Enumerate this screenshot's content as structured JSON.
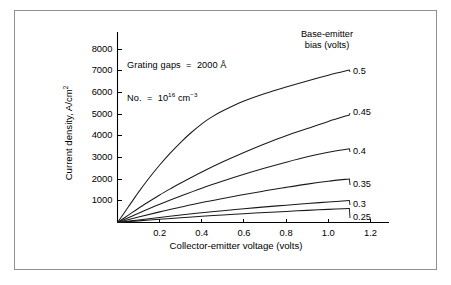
{
  "chart_data": {
    "type": "line",
    "title": "",
    "xlabel": "Collector-emitter voltage (volts)",
    "ylabel": "Current density, A/cm²",
    "xlim": [
      0,
      1.25
    ],
    "ylim": [
      0,
      8600
    ],
    "xticks": [
      "0.2",
      "0.4",
      "0.6",
      "0.8",
      "1.0",
      "1.2"
    ],
    "xtick_values": [
      0.2,
      0.4,
      0.6,
      0.8,
      1.0,
      1.2
    ],
    "yticks": [
      "1000",
      "2000",
      "3000",
      "4000",
      "5000",
      "6000",
      "7000",
      "8000"
    ],
    "ytick_values": [
      1000,
      2000,
      3000,
      4000,
      5000,
      6000,
      7000,
      8000
    ],
    "grid": false,
    "legend_position": "right-labels",
    "legend_title": "Base-emitter bias (volts)",
    "annotations": [
      "Grating gaps  =  2000 Å",
      "No.  =  10¹⁶ cm⁻³"
    ],
    "series": [
      {
        "name": "0.5",
        "label": "0.5",
        "x": [
          0,
          0.05,
          0.1,
          0.15,
          0.2,
          0.25,
          0.3,
          0.35,
          0.4,
          0.45,
          0.5,
          0.6,
          0.7,
          0.8,
          0.9,
          1.0,
          1.1
        ],
        "values": [
          0,
          700,
          1400,
          2050,
          2650,
          3200,
          3700,
          4150,
          4550,
          4880,
          5150,
          5600,
          5950,
          6250,
          6530,
          6790,
          7030
        ]
      },
      {
        "name": "0.45",
        "label": "0.45",
        "x": [
          0,
          0.05,
          0.1,
          0.15,
          0.2,
          0.25,
          0.3,
          0.4,
          0.5,
          0.6,
          0.7,
          0.8,
          0.9,
          1.0,
          1.1
        ],
        "values": [
          0,
          330,
          660,
          970,
          1270,
          1550,
          1820,
          2330,
          2800,
          3230,
          3630,
          4000,
          4330,
          4660,
          4960
        ]
      },
      {
        "name": "0.4",
        "label": "0.4",
        "x": [
          0,
          0.1,
          0.2,
          0.3,
          0.4,
          0.5,
          0.6,
          0.7,
          0.8,
          0.9,
          1.0,
          1.1
        ],
        "values": [
          0,
          430,
          840,
          1220,
          1580,
          1910,
          2220,
          2510,
          2780,
          3030,
          3240,
          3400
        ]
      },
      {
        "name": "0.35",
        "label": "0.35",
        "x": [
          0,
          0.1,
          0.2,
          0.3,
          0.4,
          0.5,
          0.6,
          0.7,
          0.8,
          0.9,
          1.0,
          1.1
        ],
        "values": [
          0,
          250,
          490,
          710,
          920,
          1110,
          1290,
          1460,
          1620,
          1770,
          1900,
          2010
        ]
      },
      {
        "name": "0.3",
        "label": "0.3",
        "x": [
          0,
          0.1,
          0.2,
          0.3,
          0.4,
          0.5,
          0.6,
          0.7,
          0.8,
          0.9,
          1.0,
          1.1
        ],
        "values": [
          0,
          120,
          235,
          345,
          450,
          545,
          635,
          720,
          800,
          875,
          945,
          1010
        ]
      },
      {
        "name": "0.25",
        "label": "0.25",
        "x": [
          0,
          0.1,
          0.2,
          0.3,
          0.4,
          0.5,
          0.6,
          0.7,
          0.8,
          0.9,
          1.0,
          1.1
        ],
        "values": [
          0,
          75,
          148,
          218,
          285,
          348,
          405,
          460,
          512,
          560,
          605,
          648
        ]
      }
    ]
  },
  "colors": {
    "line": "#1a1a1a",
    "axis": "#000000",
    "frame": "#8f8f8f",
    "background": "#ffffff"
  }
}
